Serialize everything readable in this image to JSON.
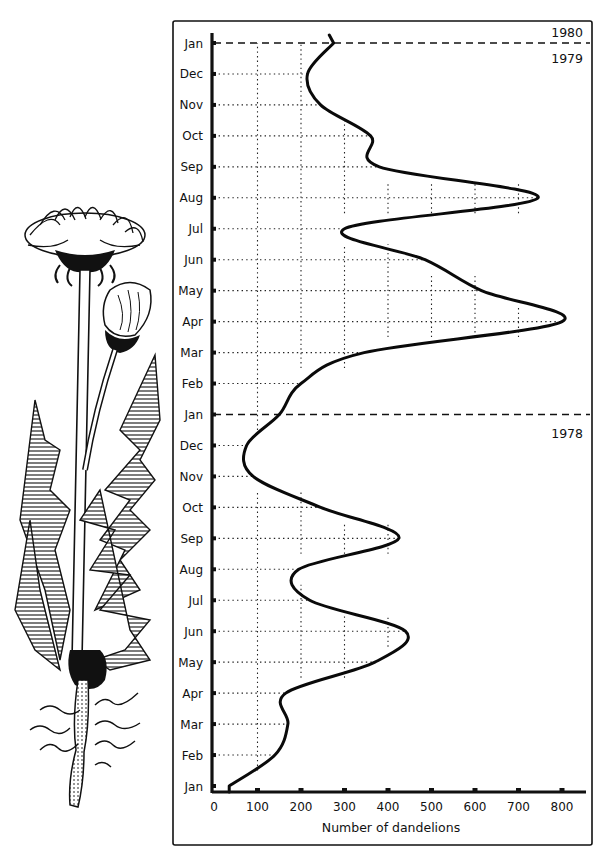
{
  "chart_data": {
    "type": "line",
    "orientation": "vertical-time (time on y-axis, value on x-axis)",
    "title": "",
    "xlabel": "Number of dandelions",
    "ylabel": "",
    "xlim": [
      0,
      850
    ],
    "x_ticks": [
      0,
      100,
      200,
      300,
      400,
      500,
      600,
      700,
      800
    ],
    "y_tick_labels": [
      "Jan",
      "Feb",
      "Mar",
      "Apr",
      "May",
      "Jun",
      "Jul",
      "Aug",
      "Sep",
      "Oct",
      "Nov",
      "Dec",
      "Jan",
      "Feb",
      "Mar",
      "Apr",
      "May",
      "Jun",
      "Jul",
      "Aug",
      "Sep",
      "Oct",
      "Nov",
      "Dec",
      "Jan"
    ],
    "grid": true,
    "year_dividers": [
      {
        "after_index": 12,
        "label_below": "1978",
        "label_above": ""
      },
      {
        "after_index": 24,
        "label_below": "1979",
        "label_above": "1980"
      }
    ],
    "annotations": [
      "1978",
      "1979",
      "1980"
    ],
    "series": [
      {
        "name": "Dandelions",
        "categories": [
          "Jan 1978",
          "Feb 1978",
          "Mar 1978",
          "Apr 1978",
          "May 1978",
          "Jun 1978",
          "Jul 1978",
          "Aug 1978",
          "Sep 1978",
          "Oct 1978",
          "Nov 1978",
          "Dec 1978",
          "Jan 1979",
          "Feb 1979",
          "Mar 1979",
          "Apr 1979",
          "May 1979",
          "Jun 1979",
          "Jul 1979",
          "Aug 1979",
          "Sep 1979",
          "Oct 1979",
          "Nov 1979",
          "Dec 1979",
          "Jan 1980"
        ],
        "values": [
          35,
          140,
          170,
          165,
          370,
          440,
          220,
          195,
          425,
          245,
          90,
          75,
          150,
          200,
          345,
          800,
          615,
          485,
          300,
          745,
          380,
          360,
          245,
          215,
          275
        ],
        "peaks": [
          {
            "when": "early Jun 1978",
            "value": 445
          },
          {
            "when": "Sep 1978",
            "value": 430
          },
          {
            "when": "Apr 1979",
            "value": 805
          },
          {
            "when": "Aug 1979",
            "value": 745
          }
        ]
      }
    ]
  },
  "illustration": {
    "subject": "dandelion plant with flower heads, toothed leaves and taproot",
    "icon": "dandelion-illustration"
  }
}
